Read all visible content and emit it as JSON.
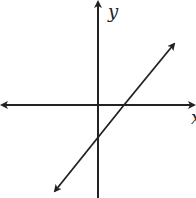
{
  "diagram": {
    "type": "coordinate-plane-line",
    "axes": {
      "x_label": "x",
      "y_label": "y"
    },
    "line": {
      "slope": "positive",
      "x_intercept": "positive",
      "y_intercept": "negative"
    },
    "colors": {
      "stroke": "#222222",
      "background": "#ffffff"
    }
  }
}
